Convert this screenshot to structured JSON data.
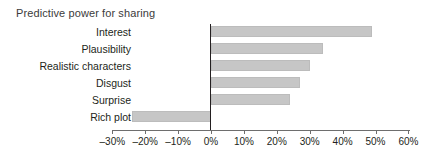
{
  "chart_data": {
    "type": "bar",
    "orientation": "horizontal",
    "title": "Predictive power for sharing",
    "xlabel": "",
    "ylabel": "",
    "categories": [
      "Interest",
      "Plausibility",
      "Realistic characters",
      "Disgust",
      "Surprise",
      "Rich plot"
    ],
    "values": [
      49,
      34,
      30,
      27,
      24,
      -24
    ],
    "value_unit": "%",
    "xlim": [
      -30,
      60
    ],
    "xticks": [
      -30,
      -20,
      -10,
      0,
      10,
      20,
      30,
      40,
      50,
      60
    ],
    "xtick_labels": [
      "–30%",
      "–20%",
      "–10%",
      "0%",
      "10%",
      "20%",
      "30%",
      "40%",
      "50%",
      "60%"
    ],
    "grid": false,
    "legend": null,
    "zero_line": 0,
    "bar_color": "#c6c6c6",
    "bar_border_color": "#bcbcbc",
    "axis_color": "#6e6e6e",
    "zero_line_color": "#231f20",
    "text_color": "#231f20",
    "title_color": "#3b3b3b",
    "background": "#ffffff",
    "series": [
      {
        "name": "Predictive power for sharing",
        "points": [
          {
            "category": "Interest",
            "value": 49,
            "label": "49%"
          },
          {
            "category": "Plausibility",
            "value": 34,
            "label": "34%"
          },
          {
            "category": "Realistic characters",
            "value": 30,
            "label": "30%"
          },
          {
            "category": "Disgust",
            "value": 27,
            "label": "27%"
          },
          {
            "category": "Surprise",
            "value": 24,
            "label": "24%"
          },
          {
            "category": "Rich plot",
            "value": -24,
            "label": "–24%"
          }
        ]
      }
    ]
  }
}
